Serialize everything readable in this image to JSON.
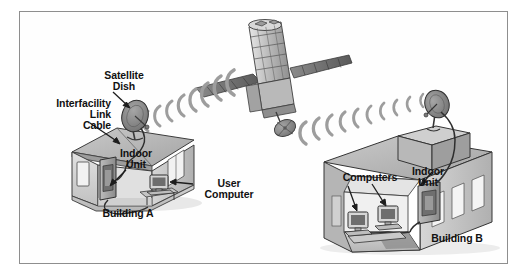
{
  "diagram": {
    "frame": {
      "border_color": "#8e8e8e",
      "background": "#fefefe"
    },
    "labels": {
      "satellite_dish": "Satellite\nDish",
      "interfacility_link_cable": "Interfacility\nLink\nCable",
      "indoor_unit_a": "Indoor\nUnit",
      "user_computer": "User\nComputer",
      "building_a": "Building A",
      "computers": "Computers",
      "indoor_unit_b": "Indoor\nUnit",
      "building_b": "Building B"
    },
    "objects": {
      "satellite": "communications-satellite",
      "dish_a": "parabolic-antenna-building-a",
      "dish_b": "parabolic-antenna-building-b",
      "indoor_unit_a": "indoor-unit-cabinet-a",
      "indoor_unit_b": "indoor-unit-cabinet-b",
      "computer_a": "desktop-computer-a",
      "computer_b1": "desktop-computer-b1",
      "computer_b2": "desktop-computer-b2",
      "uplink_waves": "radio-wave-arcs-uplink",
      "downlink_waves": "radio-wave-arcs-downlink"
    },
    "colors": {
      "ink": "#111111",
      "line": "#303030",
      "wave": "#9a9a9a",
      "wall_light": "#dcdcdc",
      "wall_mid": "#c2c2c2",
      "wall_dark": "#a8a8a8",
      "roof": "#b4b4b4",
      "shadow": "#8a8a8a",
      "dish_face": "#8d8d8d",
      "device": "#9e9e9e",
      "screen": "#6f6f6f"
    },
    "counts": {
      "buildings": 2,
      "satellites": 1,
      "dishes": 2,
      "indoor_units": 2,
      "computers": 3
    }
  }
}
